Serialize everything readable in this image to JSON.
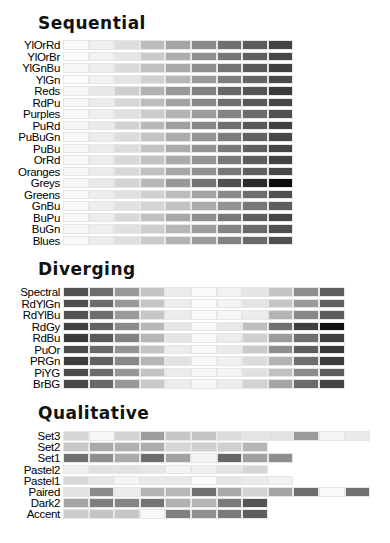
{
  "chart_data": {
    "type": "heatmap",
    "sections": [
      {
        "title": "Sequential",
        "palettes": [
          {
            "name": "YlOrRd",
            "grays": [
              "#fafafa",
              "#f0f0f0",
              "#dedede",
              "#bcbcbc",
              "#a4a4a4",
              "#8a8a8a",
              "#707070",
              "#5c5c5c",
              "#434343"
            ]
          },
          {
            "name": "YlOrBr",
            "grays": [
              "#fbfbfb",
              "#f3f3f3",
              "#e6e6e6",
              "#cacaca",
              "#adadad",
              "#8f8f8f",
              "#767676",
              "#5e5e5e",
              "#474747"
            ]
          },
          {
            "name": "YlGnBu",
            "grays": [
              "#f8f8f8",
              "#eeeeee",
              "#dadada",
              "#c0c0c0",
              "#a8a8a8",
              "#8e8e8e",
              "#747474",
              "#5a5a5a",
              "#404040"
            ]
          },
          {
            "name": "YlGn",
            "grays": [
              "#fbfbfb",
              "#f3f3f3",
              "#e4e4e4",
              "#d0d0d0",
              "#b6b6b6",
              "#9a9a9a",
              "#7e7e7e",
              "#646464",
              "#4a4a4a"
            ]
          },
          {
            "name": "Reds",
            "grays": [
              "#f6f6f6",
              "#e8e8e8",
              "#cecece",
              "#b2b2b2",
              "#989898",
              "#808080",
              "#686868",
              "#545454",
              "#3c3c3c"
            ]
          },
          {
            "name": "RdPu",
            "grays": [
              "#f7f7f7",
              "#ebebeb",
              "#d6d6d6",
              "#bcbcbc",
              "#a2a2a2",
              "#888888",
              "#6e6e6e",
              "#585858",
              "#464646"
            ]
          },
          {
            "name": "Purples",
            "grays": [
              "#f9f9f9",
              "#efefef",
              "#e0e0e0",
              "#cccccc",
              "#b4b4b4",
              "#9c9c9c",
              "#848484",
              "#6c6c6c",
              "#505050"
            ]
          },
          {
            "name": "PuRd",
            "grays": [
              "#f6f6f6",
              "#eaeaea",
              "#d2d2d2",
              "#b8b8b8",
              "#a0a0a0",
              "#888888",
              "#6e6e6e",
              "#585858",
              "#404040"
            ]
          },
          {
            "name": "PuBuGn",
            "grays": [
              "#f8f8f8",
              "#ececec",
              "#dcdcdc",
              "#c4c4c4",
              "#acacac",
              "#949494",
              "#7c7c7c",
              "#626262",
              "#484848"
            ]
          },
          {
            "name": "PuBu",
            "grays": [
              "#f8f8f8",
              "#ececec",
              "#dcdcdc",
              "#c4c4c4",
              "#acacac",
              "#949494",
              "#7a7a7a",
              "#606060",
              "#464646"
            ]
          },
          {
            "name": "OrRd",
            "grays": [
              "#f8f8f8",
              "#ececec",
              "#d8d8d8",
              "#c2c2c2",
              "#aaaaaa",
              "#929292",
              "#787878",
              "#5e5e5e",
              "#444444"
            ]
          },
          {
            "name": "Oranges",
            "grays": [
              "#f8f8f8",
              "#ececec",
              "#d8d8d8",
              "#c0c0c0",
              "#a8a8a8",
              "#909090",
              "#787878",
              "#606060",
              "#484848"
            ]
          },
          {
            "name": "Greys",
            "grays": [
              "#f6f6f6",
              "#e8e8e8",
              "#d4d4d4",
              "#b8b8b8",
              "#989898",
              "#747474",
              "#505050",
              "#2c2c2c",
              "#0c0c0c"
            ]
          },
          {
            "name": "Greens",
            "grays": [
              "#f8f8f8",
              "#eeeeee",
              "#e0e0e0",
              "#d0d0d0",
              "#bcbcbc",
              "#a4a4a4",
              "#8a8a8a",
              "#6e6e6e",
              "#505050"
            ]
          },
          {
            "name": "GnBu",
            "grays": [
              "#f8f8f8",
              "#eeeeee",
              "#e0e0e0",
              "#d4d4d4",
              "#c2c2c2",
              "#acacac",
              "#929292",
              "#787878",
              "#5e5e5e"
            ]
          },
          {
            "name": "BuPu",
            "grays": [
              "#f8f8f8",
              "#ececec",
              "#d8d8d8",
              "#c0c0c0",
              "#a8a8a8",
              "#909090",
              "#787878",
              "#5e5e5e",
              "#464646"
            ]
          },
          {
            "name": "BuGn",
            "grays": [
              "#f8f8f8",
              "#eeeeee",
              "#e0e0e0",
              "#cecece",
              "#b6b6b6",
              "#9e9e9e",
              "#848484",
              "#6a6a6a",
              "#505050"
            ]
          },
          {
            "name": "Blues",
            "grays": [
              "#f8f8f8",
              "#ececec",
              "#dedede",
              "#cacaca",
              "#b2b2b2",
              "#9a9a9a",
              "#828282",
              "#6a6a6a",
              "#505050"
            ]
          }
        ]
      },
      {
        "title": "Diverging",
        "palettes": [
          {
            "name": "Spectral",
            "grays": [
              "#505050",
              "#6e6e6e",
              "#989898",
              "#c4c4c4",
              "#ececec",
              "#fafafa",
              "#f2f2f2",
              "#e6e6e6",
              "#c4c4c4",
              "#8e8e8e",
              "#5e5e5e"
            ]
          },
          {
            "name": "RdYlGn",
            "grays": [
              "#4e4e4e",
              "#6c6c6c",
              "#989898",
              "#c4c4c4",
              "#ececec",
              "#fafafa",
              "#f4f4f4",
              "#e4e4e4",
              "#c6c6c6",
              "#9a9a9a",
              "#606060"
            ]
          },
          {
            "name": "RdYlBu",
            "grays": [
              "#525252",
              "#6e6e6e",
              "#9a9a9a",
              "#c6c6c6",
              "#ececec",
              "#fafafa",
              "#f6f6f6",
              "#ececec",
              "#b4b4b4",
              "#888888",
              "#5c5c5c"
            ]
          },
          {
            "name": "RdGy",
            "grays": [
              "#404040",
              "#626262",
              "#8a8a8a",
              "#b8b8b8",
              "#e6e6e6",
              "#fafafa",
              "#e8e8e8",
              "#bebebe",
              "#707070",
              "#3e3e3e",
              "#121212"
            ]
          },
          {
            "name": "RdBu",
            "grays": [
              "#3a3a3a",
              "#5a5a5a",
              "#828282",
              "#b6b6b6",
              "#e4e4e4",
              "#f8f8f8",
              "#ececec",
              "#d0d0d0",
              "#9c9c9c",
              "#6e6e6e",
              "#404040"
            ]
          },
          {
            "name": "PuOr",
            "grays": [
              "#4a4a4a",
              "#6a6a6a",
              "#949494",
              "#c4c4c4",
              "#ececec",
              "#f8f8f8",
              "#eaeaea",
              "#cacaca",
              "#8e8e8e",
              "#5e5e5e",
              "#3a3a3a"
            ]
          },
          {
            "name": "PRGn",
            "grays": [
              "#3e3e3e",
              "#626262",
              "#888888",
              "#b6b6b6",
              "#e2e2e2",
              "#f8f8f8",
              "#f0f0f0",
              "#dcdcdc",
              "#b2b2b2",
              "#6e6e6e",
              "#3c3c3c"
            ]
          },
          {
            "name": "PiYG",
            "grays": [
              "#4a4a4a",
              "#6c6c6c",
              "#969696",
              "#c4c4c4",
              "#ececec",
              "#f8f8f8",
              "#f4f4f4",
              "#e0e0e0",
              "#c0c0c0",
              "#8c8c8c",
              "#5e5e5e"
            ]
          },
          {
            "name": "BrBG",
            "grays": [
              "#484848",
              "#686868",
              "#989898",
              "#c8c8c8",
              "#ececec",
              "#f6f6f6",
              "#ececec",
              "#d2d2d2",
              "#a4a4a4",
              "#6a6a6a",
              "#444444"
            ]
          }
        ]
      },
      {
        "title": "Qualitative",
        "palettes": [
          {
            "name": "Set3",
            "grays": [
              "#d6d6d6",
              "#f8f8f8",
              "#d2d2d2",
              "#9e9e9e",
              "#c6c6c6",
              "#c4c4c4",
              "#dcdcdc",
              "#e4e4e4",
              "#e2e2e2",
              "#9a9a9a",
              "#f4f4f4",
              "#eaeaea"
            ]
          },
          {
            "name": "Set2",
            "grays": [
              "#c8c8c8",
              "#a8a8a8",
              "#b0b0b0",
              "#acacac",
              "#d6d6d6",
              "#cfcfcf",
              "#d0d0d0",
              "#b6b6b6"
            ]
          },
          {
            "name": "Set1",
            "grays": [
              "#707070",
              "#8e8e8e",
              "#aaaaaa",
              "#6c6c6c",
              "#a2a2a2",
              "#f4f4f4",
              "#666666",
              "#a0a0a0",
              "#8e8e8e"
            ]
          },
          {
            "name": "Pastel2",
            "grays": [
              "#f0f0f0",
              "#e0e0e0",
              "#e2e2e2",
              "#e6e6e6",
              "#f4f4f4",
              "#f0f0f0",
              "#e4e4e4",
              "#d6d6d6"
            ]
          },
          {
            "name": "Pastel1",
            "grays": [
              "#d8d8d8",
              "#e6e6e6",
              "#f4f4f4",
              "#e8e8e8",
              "#e8e8e8",
              "#fafafa",
              "#e6e6e6",
              "#eaeaea",
              "#f2f2f2"
            ]
          },
          {
            "name": "Paired",
            "grays": [
              "#e2e2e2",
              "#8c8c8c",
              "#ececec",
              "#b4b4b4",
              "#b8b8b8",
              "#707070",
              "#a8a8a8",
              "#d4d4d4",
              "#a4a4a4",
              "#6e6e6e",
              "#fafafa",
              "#707070"
            ]
          },
          {
            "name": "Dark2",
            "grays": [
              "#a4a4a4",
              "#7e7e7e",
              "#858585",
              "#747474",
              "#b0b0b0",
              "#b4b4b4",
              "#7a7a7a",
              "#545454"
            ]
          },
          {
            "name": "Accent",
            "grays": [
              "#cccccc",
              "#c4c4c4",
              "#c6c6c6",
              "#f8f8f8",
              "#808080",
              "#909090",
              "#7a7a7a",
              "#5e5e5e"
            ]
          }
        ]
      }
    ],
    "xlabel": "",
    "ylabel": "",
    "grid": false,
    "legend": "none"
  },
  "sections": {
    "sequential": {
      "title": "Sequential"
    },
    "diverging": {
      "title": "Diverging"
    },
    "qualitative": {
      "title": "Qualitative"
    }
  }
}
